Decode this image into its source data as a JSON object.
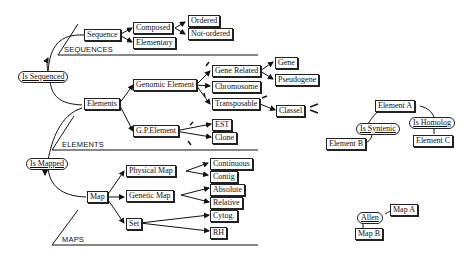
{
  "diagram": {
    "relations": {
      "is_sequenced": "Is Sequenced",
      "is_mapped": "Is Mapped",
      "is_syntenic": "Is Syntenic",
      "is_homolog": "Is Homolog",
      "allen": "Allen"
    },
    "sections": {
      "sequences": "SEQUENCES",
      "elements": "ELEMENTS",
      "maps": "MAPS"
    },
    "nodes": {
      "sequence": "Sequence",
      "composed": "Composed",
      "ordered": "Ordered",
      "not_ordered": "Not-ordered",
      "elementary": "Elementary",
      "elements": "Elements",
      "genomic_element": "Genomic Element",
      "gene_related": "Gene Related",
      "gene": "Gene",
      "pseudogene": "Pseudogene",
      "chromosome": "Chromosome",
      "transposable": "Transposable",
      "classel": "Classel",
      "gp_element": "G.P.Element",
      "est": "EST",
      "clone": "Clone",
      "map": "Map",
      "physical_map": "Physical Map",
      "continuous": "Continuous",
      "contig": "Contig",
      "genetic_map": "Genetic Map",
      "absolute": "Absolute",
      "relative": "Relative",
      "set": "Set",
      "cytog": "Cytog.",
      "rh": "RH",
      "element_a": "Element A",
      "element_b": "Element B",
      "element_c": "Element C",
      "map_a": "Map A",
      "map_b": "Map B"
    }
  }
}
